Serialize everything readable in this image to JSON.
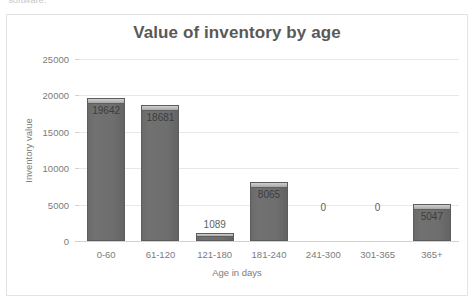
{
  "top_sliver": {
    "text": "software."
  },
  "chart_data": {
    "type": "bar",
    "title": "Value of inventory by age",
    "xlabel": "Age in days",
    "ylabel": "Inventory value",
    "categories": [
      "0-60",
      "61-120",
      "121-180",
      "181-240",
      "241-300",
      "301-365",
      "365+"
    ],
    "values": [
      19642,
      18681,
      1089,
      8065,
      0,
      0,
      5047
    ],
    "data_labels": [
      "19642",
      "18681",
      "1089",
      "8065",
      "0",
      "0",
      "5047"
    ],
    "ylim": [
      0,
      25000
    ],
    "yticks": [
      0,
      5000,
      10000,
      15000,
      20000,
      25000
    ],
    "ytick_labels": [
      "0",
      "5000",
      "10000",
      "15000",
      "20000",
      "25000"
    ],
    "grid": true,
    "legend": false,
    "series_color": "#6e6e6e",
    "title_color": "#595959",
    "axis_text_color": "#7b7b7b",
    "gridline_color": "#e8e8e8",
    "plot_background": "#ffffff",
    "frame_border_color": "#e3e3e3"
  }
}
